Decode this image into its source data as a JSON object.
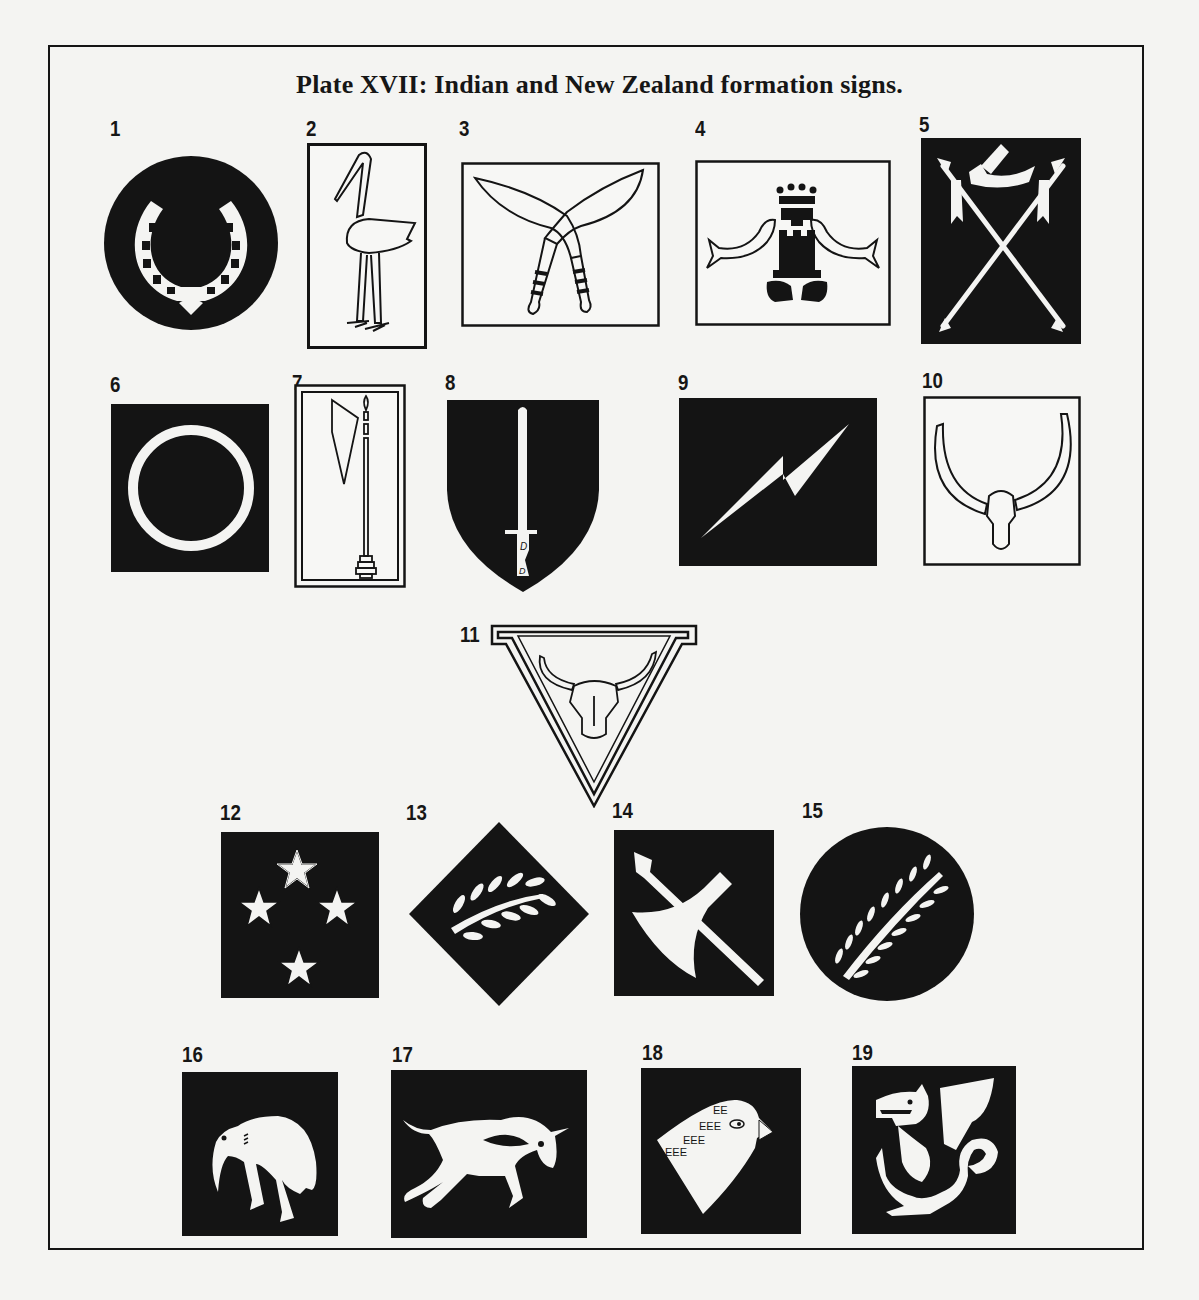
{
  "plate": {
    "title": "Plate XVII: Indian and New Zealand formation signs.",
    "colors": {
      "ink": "#141414",
      "paper": "#f4f4f2"
    }
  },
  "signs": [
    {
      "number": "1",
      "description": "Horseshoe on black circle"
    },
    {
      "number": "2",
      "description": "Stork outline on white rectangle"
    },
    {
      "number": "3",
      "description": "Crossed kukri knives on white rectangle"
    },
    {
      "number": "4",
      "description": "Crowned castle with dolphins on white rectangle"
    },
    {
      "number": "5",
      "description": "Crossed lances and horn on black rectangle"
    },
    {
      "number": "6",
      "description": "White ring on black square"
    },
    {
      "number": "7",
      "description": "Axe on pole on double-bordered white rectangle"
    },
    {
      "number": "8",
      "description": "Sword on black shield"
    },
    {
      "number": "9",
      "description": "Lightning bolt on black rectangle"
    },
    {
      "number": "10",
      "description": "Bull head with long horns on white square"
    },
    {
      "number": "11",
      "description": "Bull head in inverted triangle"
    },
    {
      "number": "12",
      "description": "Four stars (Southern Cross) on black square"
    },
    {
      "number": "13",
      "description": "Leaf branch on black diamond"
    },
    {
      "number": "14",
      "description": "Axe and spear on black square"
    },
    {
      "number": "15",
      "description": "Fern leaf on black circle"
    },
    {
      "number": "16",
      "description": "Kiwi on black square"
    },
    {
      "number": "17",
      "description": "Charging bull on black rectangle"
    },
    {
      "number": "18",
      "description": "Parrot head on black square"
    },
    {
      "number": "19",
      "description": "Dragon on black square"
    }
  ]
}
